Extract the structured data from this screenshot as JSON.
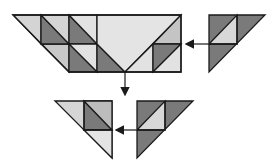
{
  "diagram": {
    "colors": {
      "light": "#d4d4d4",
      "lighter": "#e6e6e6",
      "mid": "#bcbcbc",
      "dark": "#7a7a7a",
      "outline": "#1a1a1a",
      "background": "#ffffff"
    },
    "figures": [
      {
        "id": "top-trapezoid",
        "shape": "trapezoid",
        "grid_unit": 28
      },
      {
        "id": "top-right-triangle",
        "shape": "right-triangle"
      },
      {
        "id": "bottom-left-triangle",
        "shape": "right-triangle"
      },
      {
        "id": "bottom-right-triangle",
        "shape": "right-triangle"
      }
    ],
    "arrows": [
      {
        "id": "arrow-right-to-trapezoid",
        "direction": "left"
      },
      {
        "id": "arrow-trapezoid-down",
        "direction": "down"
      },
      {
        "id": "arrow-bottom-right-to-left",
        "direction": "left"
      }
    ]
  }
}
